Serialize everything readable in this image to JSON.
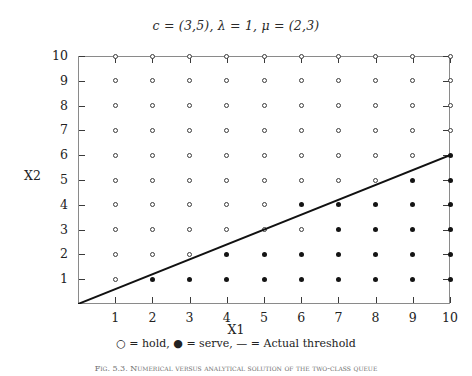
{
  "chart_data": {
    "type": "scatter",
    "title": "c = (3,5), λ = 1, μ = (2,3)",
    "xlabel": "X1",
    "ylabel": "X2",
    "xlim": [
      0,
      10
    ],
    "ylim": [
      0,
      10
    ],
    "xticks": [
      1,
      2,
      3,
      4,
      5,
      6,
      7,
      8,
      9,
      10
    ],
    "yticks": [
      1,
      2,
      3,
      4,
      5,
      6,
      7,
      8,
      9,
      10
    ],
    "grid": false,
    "legend_position": "below-axes",
    "series": [
      {
        "name": "hold",
        "marker": "open-circle",
        "color": "#3c3c3c",
        "points": [
          [
            1,
            1
          ],
          [
            1,
            2
          ],
          [
            2,
            2
          ],
          [
            3,
            2
          ],
          [
            1,
            3
          ],
          [
            2,
            3
          ],
          [
            3,
            3
          ],
          [
            4,
            3
          ],
          [
            5,
            3
          ],
          [
            6,
            3
          ],
          [
            1,
            4
          ],
          [
            2,
            4
          ],
          [
            3,
            4
          ],
          [
            4,
            4
          ],
          [
            5,
            4
          ],
          [
            1,
            5
          ],
          [
            2,
            5
          ],
          [
            3,
            5
          ],
          [
            4,
            5
          ],
          [
            5,
            5
          ],
          [
            6,
            5
          ],
          [
            7,
            5
          ],
          [
            8,
            5
          ],
          [
            1,
            6
          ],
          [
            2,
            6
          ],
          [
            3,
            6
          ],
          [
            4,
            6
          ],
          [
            5,
            6
          ],
          [
            6,
            6
          ],
          [
            7,
            6
          ],
          [
            8,
            6
          ],
          [
            9,
            6
          ],
          [
            1,
            7
          ],
          [
            2,
            7
          ],
          [
            3,
            7
          ],
          [
            4,
            7
          ],
          [
            5,
            7
          ],
          [
            6,
            7
          ],
          [
            7,
            7
          ],
          [
            8,
            7
          ],
          [
            9,
            7
          ],
          [
            10,
            7
          ],
          [
            1,
            8
          ],
          [
            2,
            8
          ],
          [
            3,
            8
          ],
          [
            4,
            8
          ],
          [
            5,
            8
          ],
          [
            6,
            8
          ],
          [
            7,
            8
          ],
          [
            8,
            8
          ],
          [
            9,
            8
          ],
          [
            10,
            8
          ],
          [
            1,
            9
          ],
          [
            2,
            9
          ],
          [
            3,
            9
          ],
          [
            4,
            9
          ],
          [
            5,
            9
          ],
          [
            6,
            9
          ],
          [
            7,
            9
          ],
          [
            8,
            9
          ],
          [
            9,
            9
          ],
          [
            10,
            9
          ],
          [
            1,
            10
          ],
          [
            2,
            10
          ],
          [
            3,
            10
          ],
          [
            4,
            10
          ],
          [
            5,
            10
          ],
          [
            6,
            10
          ],
          [
            7,
            10
          ],
          [
            8,
            10
          ],
          [
            9,
            10
          ],
          [
            10,
            10
          ]
        ]
      },
      {
        "name": "serve",
        "marker": "filled-circle",
        "color": "#141414",
        "points": [
          [
            2,
            1
          ],
          [
            3,
            1
          ],
          [
            4,
            1
          ],
          [
            5,
            1
          ],
          [
            6,
            1
          ],
          [
            7,
            1
          ],
          [
            8,
            1
          ],
          [
            9,
            1
          ],
          [
            10,
            1
          ],
          [
            4,
            2
          ],
          [
            5,
            2
          ],
          [
            6,
            2
          ],
          [
            7,
            2
          ],
          [
            8,
            2
          ],
          [
            9,
            2
          ],
          [
            10,
            2
          ],
          [
            7,
            3
          ],
          [
            8,
            3
          ],
          [
            9,
            3
          ],
          [
            10,
            3
          ],
          [
            6,
            4
          ],
          [
            7,
            4
          ],
          [
            8,
            4
          ],
          [
            9,
            4
          ],
          [
            10,
            4
          ],
          [
            9,
            5
          ],
          [
            10,
            5
          ],
          [
            10,
            6
          ]
        ]
      }
    ],
    "threshold_line": {
      "name": "Actual threshold",
      "style": "solid",
      "color": "#111111",
      "width_px": 2,
      "from": [
        0,
        0
      ],
      "to": [
        10,
        6
      ],
      "slope": 0.6
    }
  },
  "legend": {
    "hold_glyph": "○",
    "hold_text": "= hold,",
    "serve_glyph": "●",
    "serve_text": "= serve,",
    "line_glyph": "—",
    "line_text": "= Actual threshold"
  },
  "caption": {
    "text": "Fig. 5.3.  Numerical  versus  analytical  solution  of  the  two-class  queue"
  },
  "colors": {
    "axis": "#8a8a8a",
    "tick": "#3a3a3a",
    "marker_open": "#3c3c3c",
    "marker_filled": "#141414",
    "threshold": "#111111",
    "text": "#222222"
  }
}
